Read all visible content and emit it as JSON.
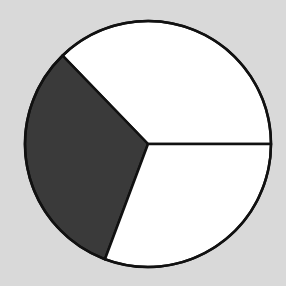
{
  "chart_data": {
    "type": "pie",
    "title": "",
    "labels": [
      "Slice A",
      "Slice B",
      "Slice C"
    ],
    "values": [
      37.2,
      32.1,
      30.7
    ],
    "angles_deg": [
      134,
      115.5,
      110.5
    ],
    "start_angle_deg": 0,
    "direction": "counterclockwise",
    "colors": [
      "#ffffff",
      "#3a3a3a",
      "#ffffff"
    ],
    "stroke_color": "#111111",
    "legend": "none",
    "center": [
      148,
      144
    ],
    "radius": 123
  },
  "colors": {
    "background": "#d9d9d9"
  }
}
